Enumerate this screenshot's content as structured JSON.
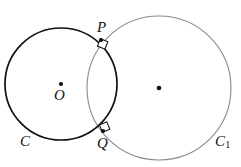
{
  "figure": {
    "background_color": "#ffffff",
    "width": 241,
    "height": 167
  },
  "labels": {
    "p": "P",
    "q": "Q",
    "o": "O",
    "c": "C",
    "c1_base": "C",
    "c1_subscript": "1"
  },
  "chart_data": {
    "type": "diagram",
    "xlabel": "",
    "ylabel": "",
    "xlim": [
      0,
      241
    ],
    "ylim": [
      0,
      167
    ],
    "grid": false,
    "legend": false,
    "circles": [
      {
        "name": "C",
        "label": "C",
        "cx": 61,
        "cy": 84,
        "r": 56,
        "stroke": "#111111",
        "stroke_width": 1.7,
        "fill": "none",
        "center_dot": true,
        "center_dot_color": "#111111",
        "center_label": "O"
      },
      {
        "name": "C1",
        "label": "C₁",
        "cx": 159,
        "cy": 88,
        "r": 72,
        "stroke": "#8a8a8a",
        "stroke_width": 1.1,
        "fill": "none",
        "center_dot": true,
        "center_dot_color": "#111111",
        "center_label": ""
      }
    ],
    "points": [
      {
        "name": "P",
        "label": "P",
        "x": 101,
        "y": 40,
        "dot": true,
        "dot_color": "#111111"
      },
      {
        "name": "Q",
        "label": "Q",
        "x": 103,
        "y": 131,
        "dot": true,
        "dot_color": "#111111"
      },
      {
        "name": "O",
        "label": "O",
        "x": 61,
        "y": 84,
        "dot": true,
        "dot_color": "#111111"
      },
      {
        "name": "O1",
        "label": "",
        "x": 159,
        "y": 88,
        "dot": true,
        "dot_color": "#111111"
      }
    ],
    "right_angle_markers": [
      {
        "at": "P",
        "x": 101,
        "y": 40,
        "size": 7,
        "stroke": "#111111"
      },
      {
        "at": "Q",
        "x": 103,
        "y": 131,
        "size": 7,
        "stroke": "#111111"
      }
    ],
    "annotations": [
      "Circle C and circle C1 intersect at points P and Q",
      "Right-angle marks at P and Q indicate the circles are orthogonal"
    ]
  }
}
